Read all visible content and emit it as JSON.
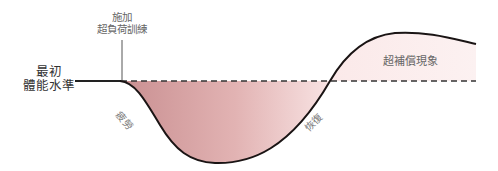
{
  "diagram": {
    "annotation": {
      "line1": "施加",
      "line2": "超負荷訓練"
    },
    "initial_level": {
      "line1": "最初",
      "line2": "體能水準"
    },
    "phases": {
      "fatigue": "疲勞",
      "recovery": "恢復",
      "supercompensation": "超補償現象"
    },
    "colors": {
      "curve": "#1a1414",
      "baseline": "#222222",
      "fatigue_fill_start": "#c98f91",
      "fatigue_fill_end": "#f7dfdf",
      "supercomp_fill": "#fbeeee"
    }
  }
}
